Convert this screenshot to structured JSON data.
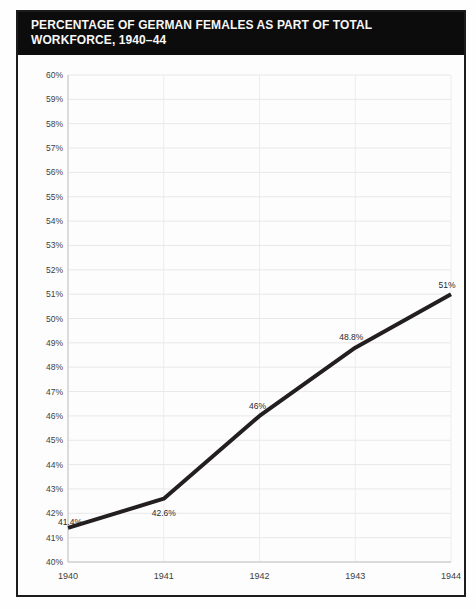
{
  "page": {
    "title": "PERCENTAGE OF GERMAN FEMALES AS PART OF TOTAL WORKFORCE, 1940–44"
  },
  "chart_data": {
    "type": "line",
    "title": "PERCENTAGE OF GERMAN FEMALES AS PART OF TOTAL WORKFORCE, 1940–44",
    "categories": [
      "1940",
      "1941",
      "1942",
      "1943",
      "1944"
    ],
    "values": [
      41.4,
      42.6,
      46,
      48.8,
      51
    ],
    "point_labels": [
      "41.4%",
      "42.6%",
      "46%",
      "48.8%",
      "51%"
    ],
    "xlabel": "",
    "ylabel": "",
    "ylim": [
      40,
      60
    ],
    "ytick_step": 1,
    "ytick_suffix": "%",
    "grid": true,
    "legend": "none",
    "label_offsets": [
      [
        2,
        -3
      ],
      [
        0,
        17
      ],
      [
        -2,
        -7
      ],
      [
        -4,
        -8
      ],
      [
        -4,
        -6
      ]
    ],
    "colors": {
      "line": "#231f20",
      "grid_h": "#e8e8e8",
      "grid_v": "#ededed",
      "axis": "#c2c2c2",
      "tick_text": "#3d3d3d",
      "label_text": "#2a2a2a",
      "titlebar_bg": "#0c0c0c",
      "titlebar_text": "#f7f7f7",
      "border": "#1c1c1c",
      "plot_bg": "#fdfdfd"
    }
  }
}
